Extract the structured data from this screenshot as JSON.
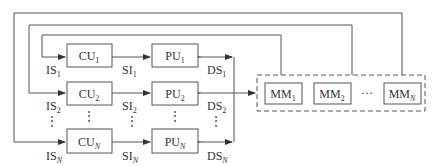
{
  "diagram": {
    "rows": [
      {
        "cu": {
          "base": "CU",
          "sub": "1"
        },
        "pu": {
          "base": "PU",
          "sub": "1"
        },
        "is": {
          "base": "IS",
          "sub": "1"
        },
        "si": {
          "base": "SI",
          "sub": "1"
        },
        "ds": {
          "base": "DS",
          "sub": "1"
        }
      },
      {
        "cu": {
          "base": "CU",
          "sub": "2"
        },
        "pu": {
          "base": "PU",
          "sub": "2"
        },
        "is": {
          "base": "IS",
          "sub": "2"
        },
        "si": {
          "base": "SI",
          "sub": "2"
        },
        "ds": {
          "base": "DS",
          "sub": "2"
        }
      },
      {
        "cu": {
          "base": "CU",
          "sub": "N"
        },
        "pu": {
          "base": "PU",
          "sub": "N"
        },
        "is": {
          "base": "IS",
          "sub": "N"
        },
        "si": {
          "base": "SI",
          "sub": "N"
        },
        "ds": {
          "base": "DS",
          "sub": "N"
        }
      }
    ],
    "memory_modules": [
      {
        "base": "MM",
        "sub": "1"
      },
      {
        "base": "MM",
        "sub": "2"
      },
      {
        "base": "MM",
        "sub": "N"
      }
    ],
    "ellipsis_horizontal": "···",
    "ellipsis_vertical": "⋮"
  }
}
